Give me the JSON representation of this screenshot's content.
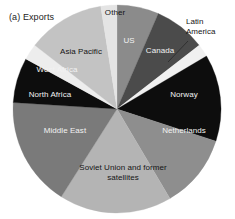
{
  "chart_data": {
    "type": "pie",
    "title": "(a) Exports",
    "xlabel": "",
    "ylabel": "",
    "legend_position": "none",
    "grid": false,
    "labels_on_slices": true,
    "categories": [
      "US",
      "Canada",
      "Latin America",
      "Norway",
      "Netherlands",
      "Soviet Union and former satellites",
      "Middle East",
      "North Africa",
      "West Africa",
      "Asia Pacific",
      "Other"
    ],
    "values": [
      6.5,
      8.0,
      2.0,
      13.5,
      11.5,
      17.5,
      17.0,
      7.0,
      2.5,
      12.0,
      2.5
    ],
    "colors": [
      "#8b8b8b",
      "#4b4b4b",
      "#f0f0f0",
      "#0d0d0d",
      "#8e8e8e",
      "#b4b4b4",
      "#7a7a7a",
      "#0d0d0d",
      "#ededed",
      "#c3c3c3",
      "#e4e4e4"
    ],
    "label_text_colors": [
      "light",
      "light",
      "dark",
      "light",
      "light",
      "dark",
      "light",
      "light",
      "light",
      "dark",
      "dark"
    ]
  },
  "chart": {
    "title": "(a) Exports",
    "slices": [
      {
        "label": "Other",
        "label_x": 115,
        "label_y": 13,
        "tone": "dark"
      },
      {
        "label": "US",
        "label_x": 129,
        "label_y": 41,
        "tone": "light"
      },
      {
        "label": "Canada",
        "label_x": 160,
        "label_y": 51,
        "tone": "light"
      },
      {
        "label": "Norway",
        "label_x": 184,
        "label_y": 95,
        "tone": "light"
      },
      {
        "label": "Netherlands",
        "label_x": 184,
        "label_y": 131,
        "tone": "light"
      },
      {
        "label": "Middle East",
        "label_x": 65,
        "label_y": 131,
        "tone": "light"
      },
      {
        "label": "North Africa",
        "label_x": 50,
        "label_y": 95,
        "tone": "light"
      },
      {
        "label": "West Africa",
        "label_x": 57,
        "label_y": 70,
        "tone": "light"
      },
      {
        "label": "Asia Pacific",
        "label_x": 81,
        "label_y": 52,
        "tone": "dark"
      }
    ],
    "multiline_slices": [
      {
        "line1": "Soviet Union and former",
        "line2": "satellites",
        "label_x": 123,
        "label_y": 172,
        "tone": "dark"
      }
    ],
    "callouts": [
      {
        "line1": "Latin",
        "line2": "America",
        "text_x": 186,
        "text_y": 17
      }
    ]
  }
}
